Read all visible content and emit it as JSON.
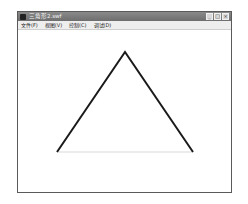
{
  "window": {
    "title": "三角形2.swf",
    "controls": {
      "minimize": "_",
      "maximize": "□",
      "close": "×"
    }
  },
  "menubar": {
    "items": [
      {
        "label": "文件(F)"
      },
      {
        "label": "视图(V)"
      },
      {
        "label": "控制(C)"
      },
      {
        "label": "调试(D)"
      }
    ]
  },
  "canvas": {
    "shape": "triangle",
    "stroke_color": "#1a1a1a",
    "baseline_color": "#e6e6e6",
    "vertices": {
      "apex": [
        125,
        52
      ],
      "left": [
        57,
        152
      ],
      "right": [
        193,
        152
      ]
    }
  }
}
